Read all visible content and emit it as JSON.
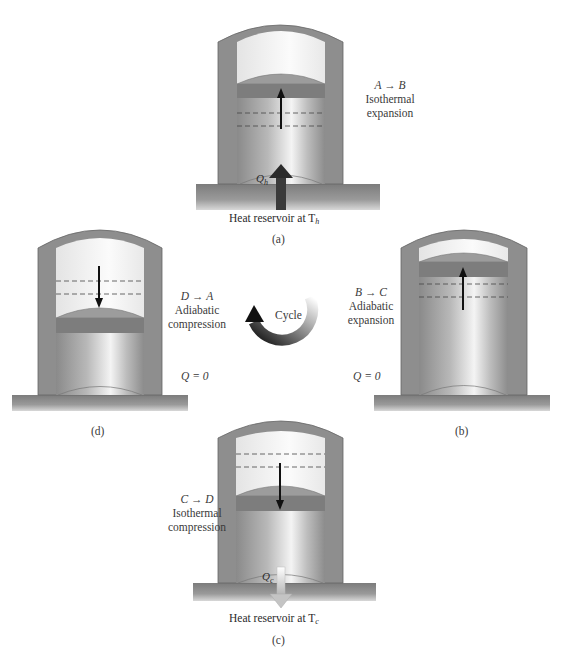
{
  "diagram": {
    "panels": [
      {
        "id": "a",
        "caption": "(a)",
        "process": "A → B",
        "type_line1": "Isothermal",
        "type_line2": "expansion",
        "heat_symbol": "Q",
        "heat_sub": "h",
        "reservoir_label": "Heat reservoir at T",
        "reservoir_sub": "h",
        "piston_motion": "up"
      },
      {
        "id": "b",
        "caption": "(b)",
        "process": "B → C",
        "type_line1": "Adiabatic",
        "type_line2": "expansion",
        "heat_note": "Q = 0",
        "piston_motion": "up"
      },
      {
        "id": "c",
        "caption": "(c)",
        "process": "C → D",
        "type_line1": "Isothermal",
        "type_line2": "compression",
        "heat_symbol": "Q",
        "heat_sub": "c",
        "reservoir_label": "Heat reservoir at T",
        "reservoir_sub": "c",
        "piston_motion": "down"
      },
      {
        "id": "d",
        "caption": "(d)",
        "process": "D → A",
        "type_line1": "Adiabatic",
        "type_line2": "compression",
        "heat_note": "Q = 0",
        "piston_motion": "down"
      }
    ],
    "center": {
      "label": "Cycle",
      "direction": "counterclockwise"
    },
    "colors": {
      "wall": "#8e8e8e",
      "gas": "#f2f2f2",
      "piston_cap": "#9a9a9a",
      "piston_band": "#7e7e7e",
      "ground": "#8a8a8a",
      "arrow": "#222222"
    }
  }
}
